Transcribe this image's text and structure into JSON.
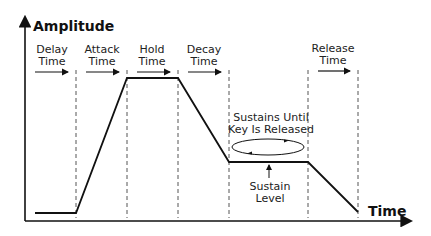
{
  "axes": {
    "y_label": "Amplitude",
    "x_label": "Time"
  },
  "phases": [
    {
      "id": "delay",
      "line1": "Delay",
      "line2": "Time"
    },
    {
      "id": "attack",
      "line1": "Attack",
      "line2": "Time"
    },
    {
      "id": "hold",
      "line1": "Hold",
      "line2": "Time"
    },
    {
      "id": "decay",
      "line1": "Decay",
      "line2": "Time"
    },
    {
      "id": "release",
      "line1": "Release",
      "line2": "Time"
    }
  ],
  "annotations": {
    "sustain_loop_line1": "Sustains Until",
    "sustain_loop_line2": "Key Is Released",
    "sustain_level_line1": "Sustain",
    "sustain_level_line2": "Level"
  },
  "colors": {
    "line": "#111111",
    "dashed": "#555555"
  }
}
